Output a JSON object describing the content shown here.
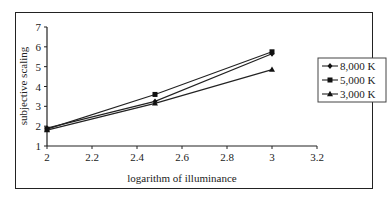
{
  "chart_data": {
    "type": "line",
    "title": "",
    "xlabel": "logarithm of illuminance",
    "ylabel": "subjective scaling",
    "xlim": [
      2,
      3.2
    ],
    "ylim": [
      1,
      7
    ],
    "x_ticks": [
      "2",
      "2.2",
      "2.4",
      "2.6",
      "2.8",
      "3",
      "3.2"
    ],
    "y_ticks": [
      "1",
      "2",
      "3",
      "4",
      "5",
      "6",
      "7"
    ],
    "x": [
      2,
      2.48,
      3
    ],
    "series": [
      {
        "name": "8,000 K",
        "marker": "diamond",
        "values": [
          1.9,
          3.25,
          5.65
        ]
      },
      {
        "name": "5,000 K",
        "marker": "square",
        "values": [
          1.85,
          3.6,
          5.75
        ]
      },
      {
        "name": "3,000 K",
        "marker": "triangle",
        "values": [
          1.8,
          3.15,
          4.85
        ]
      }
    ],
    "grid": false,
    "legend_position": "right"
  }
}
